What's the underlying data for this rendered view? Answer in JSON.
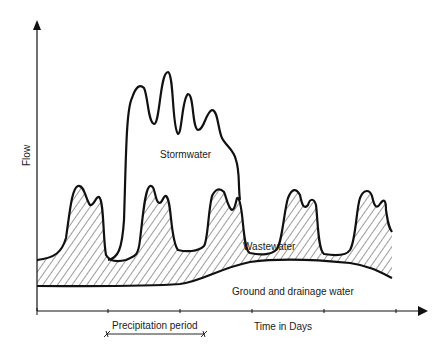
{
  "diagram": {
    "axes": {
      "y_label": "Flow",
      "x_label": "Time in Days"
    },
    "regions": {
      "stormwater": "Stormwater",
      "wastewater": "Wastewater",
      "ground": "Ground and drainage water"
    },
    "annotation": {
      "precipitation": "Precipitation period"
    },
    "colors": {
      "line": "#111111",
      "hatch": "#222222",
      "background": "#ffffff"
    }
  }
}
